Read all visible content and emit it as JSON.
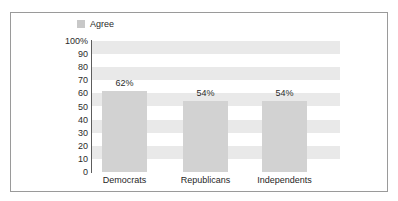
{
  "legend": {
    "swatch_name": "legend-swatch",
    "label": "Agree",
    "color": "#c8c8c8",
    "position": "top-left"
  },
  "axis": {
    "y_ticks": [
      "100%",
      "90",
      "80",
      "70",
      "60",
      "50",
      "40",
      "30",
      "20",
      "10",
      "0"
    ]
  },
  "chart_data": {
    "type": "bar",
    "title": "",
    "subtitle": "",
    "xlabel": "",
    "ylabel": "",
    "categories": [
      "Democrats",
      "Republicans",
      "Independents"
    ],
    "series": [
      {
        "name": "Agree",
        "values": [
          62,
          54,
          54
        ],
        "color": "#d2d2d2"
      }
    ],
    "data_labels": [
      "62%",
      "54%",
      "54%"
    ],
    "ylim": [
      0,
      100
    ],
    "y_tick_values": [
      0,
      10,
      20,
      30,
      40,
      50,
      60,
      70,
      80,
      90,
      100
    ],
    "y_tick_labels": [
      "0",
      "10",
      "20",
      "30",
      "40",
      "50",
      "60",
      "70",
      "80",
      "90",
      "100%"
    ],
    "grid": "horizontal-alternating-bands",
    "band_color": "#e9e9e9",
    "legend": [
      "Agree"
    ],
    "legend_position": "top-left",
    "background": "#ffffff",
    "border_color": "#9a9a9a"
  }
}
